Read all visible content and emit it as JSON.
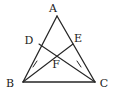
{
  "figure": {
    "kind": "geometry-diagram",
    "background_color": "#ffffff",
    "stroke_color": "#262626",
    "label_color": "#1a1a1a",
    "width": 113,
    "height": 93,
    "points": [
      {
        "id": "A",
        "label": "A",
        "x": 57,
        "y": 16,
        "label_x": 53,
        "label_y": 11
      },
      {
        "id": "B",
        "label": "B",
        "x": 23,
        "y": 82,
        "label_x": 6,
        "label_y": 86
      },
      {
        "id": "C",
        "label": "C",
        "x": 95,
        "y": 82,
        "label_x": 98,
        "label_y": 86
      },
      {
        "id": "D",
        "label": "D",
        "x": 39,
        "y": 44,
        "label_x": 25,
        "label_y": 43
      },
      {
        "id": "E",
        "label": "E",
        "x": 73,
        "y": 44,
        "label_x": 74,
        "label_y": 41
      },
      {
        "id": "F",
        "label": "F",
        "x": 56,
        "y": 58,
        "label_x": 53,
        "label_y": 66
      }
    ],
    "segments": [
      {
        "id": "AB",
        "from": "A",
        "to": "B",
        "name": "side-ab"
      },
      {
        "id": "AC",
        "from": "A",
        "to": "C",
        "name": "side-ac"
      },
      {
        "id": "BC",
        "from": "B",
        "to": "C",
        "name": "side-bc"
      },
      {
        "id": "BE",
        "from": "B",
        "to": "E",
        "name": "cevian-be"
      },
      {
        "id": "CD",
        "from": "C",
        "to": "D",
        "name": "cevian-cd"
      }
    ],
    "tick_marks": [
      {
        "id": "tick-bf",
        "on_segment": "BE",
        "x": 33,
        "y": 62,
        "angle": -27,
        "count": 1
      },
      {
        "id": "tick-cf",
        "on_segment": "CD",
        "x": 80,
        "y": 62,
        "angle": 27,
        "count": 1
      }
    ]
  }
}
